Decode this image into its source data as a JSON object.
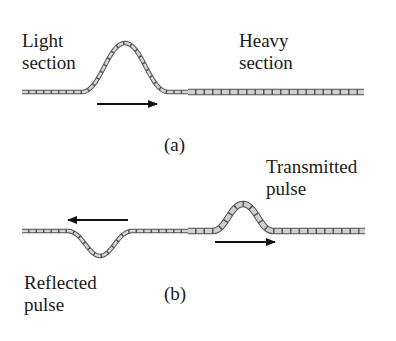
{
  "panel_a": {
    "caption": "(a)",
    "light_label_1": "Light",
    "light_label_2": "section",
    "heavy_label_1": "Heavy",
    "heavy_label_2": "section",
    "arrow_direction": "right"
  },
  "panel_b": {
    "caption": "(b)",
    "transmitted_label_1": "Transmitted",
    "transmitted_label_2": "pulse",
    "reflected_label_1": "Reflected",
    "reflected_label_2": "pulse",
    "reflected_arrow_direction": "left",
    "transmitted_arrow_direction": "right"
  },
  "colors": {
    "string_fill": "#c8c8c8",
    "string_stroke": "#555555",
    "arrow": "#111111"
  }
}
